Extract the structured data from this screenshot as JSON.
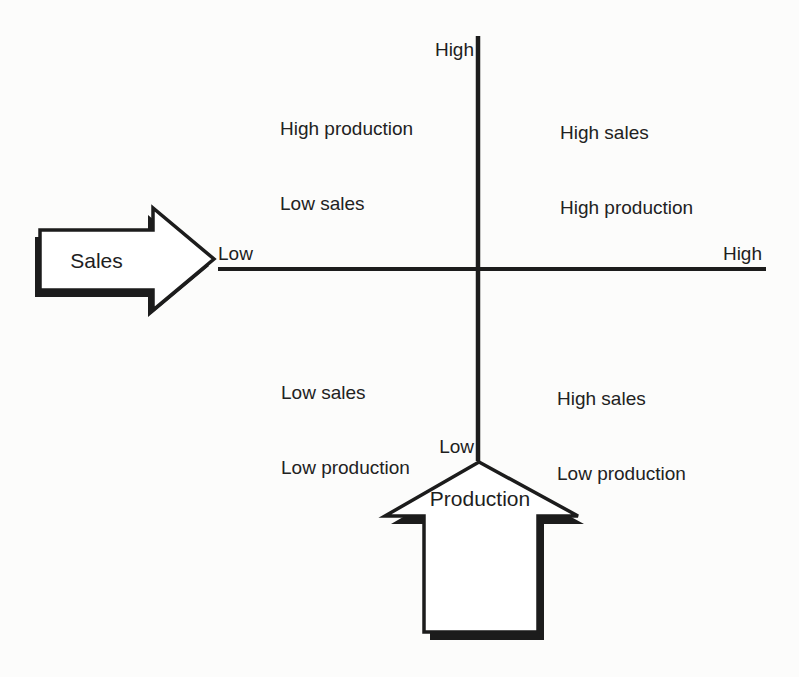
{
  "colors": {
    "ink": "#1c1c1c",
    "paper": "#fcfcfb",
    "arrow_fill": "#ffffff"
  },
  "axis_labels": {
    "vertical_top": "High",
    "vertical_bottom": "Low",
    "horizontal_left": "Low",
    "horizontal_right": "High"
  },
  "arrows": {
    "sales_label": "Sales",
    "production_label": "Production"
  },
  "quadrants": {
    "top_left": {
      "lines": [
        "High production",
        "Low sales"
      ]
    },
    "top_right": {
      "lines": [
        "High sales",
        "High production"
      ]
    },
    "bottom_left": {
      "lines": [
        "Low sales",
        "Low production"
      ]
    },
    "bottom_right": {
      "lines": [
        "High sales",
        "Low production"
      ]
    }
  }
}
